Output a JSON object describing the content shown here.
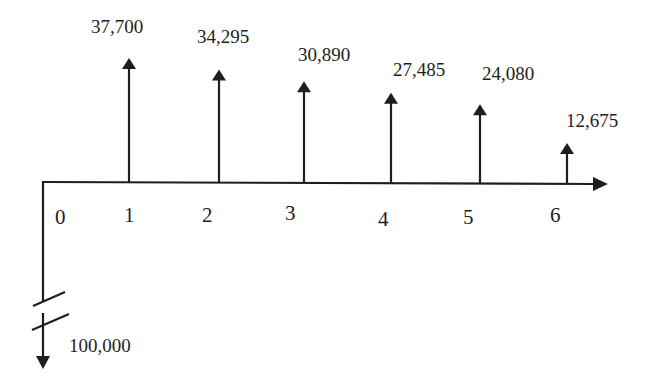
{
  "chart_data": {
    "type": "cash-flow-diagram",
    "title": "",
    "xlabel": "",
    "ylabel": "",
    "periods": [
      0,
      1,
      2,
      3,
      4,
      5,
      6
    ],
    "period_labels": [
      "0",
      "1",
      "2",
      "3",
      "4",
      "5",
      "6"
    ],
    "initial_outflow": {
      "period": 0,
      "value": 100000,
      "label": "100,000",
      "direction": "down",
      "axis_break": true
    },
    "inflows": [
      {
        "period": 1,
        "value": 37700,
        "label": "37,700"
      },
      {
        "period": 2,
        "value": 34295,
        "label": "34,295"
      },
      {
        "period": 3,
        "value": 30890,
        "label": "30,890"
      },
      {
        "period": 4,
        "value": 27485,
        "label": "27,485"
      },
      {
        "period": 5,
        "value": 24080,
        "label": "24,080"
      },
      {
        "period": 6,
        "value": 12675,
        "label": "12,675"
      }
    ]
  },
  "colors": {
    "ink": "#1e1e1e",
    "background": "#ffffff"
  }
}
